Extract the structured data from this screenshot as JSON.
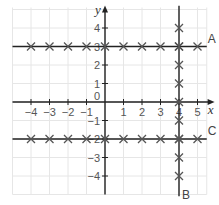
{
  "chart_data": {
    "type": "scatter",
    "title": "",
    "xlabel": "x",
    "ylabel": "y",
    "xlim": [
      -5,
      5.5
    ],
    "ylim": [
      -5,
      5
    ],
    "grid": true,
    "x_ticks": [
      "-4",
      "-3",
      "-2",
      "-1",
      "0",
      "1",
      "2",
      "3",
      "4",
      "5"
    ],
    "y_ticks": [
      "4",
      "3",
      "2",
      "1",
      "-1",
      "-2",
      "-3",
      "-4"
    ],
    "series": [
      {
        "name": "A",
        "line": "y = 3",
        "points": [
          [
            -4,
            3
          ],
          [
            -3,
            3
          ],
          [
            -2,
            3
          ],
          [
            -1,
            3
          ],
          [
            0,
            3
          ],
          [
            1,
            3
          ],
          [
            2,
            3
          ],
          [
            3,
            3
          ],
          [
            4,
            3
          ],
          [
            5,
            3
          ]
        ]
      },
      {
        "name": "B",
        "line": "x = 4",
        "points": [
          [
            4,
            4
          ],
          [
            4,
            3
          ],
          [
            4,
            2
          ],
          [
            4,
            1
          ],
          [
            4,
            0
          ],
          [
            4,
            -1
          ],
          [
            4,
            -2
          ],
          [
            4,
            -3
          ],
          [
            4,
            -4
          ]
        ]
      },
      {
        "name": "C",
        "line": "y = -2",
        "points": [
          [
            -4,
            -2
          ],
          [
            -3,
            -2
          ],
          [
            -2,
            -2
          ],
          [
            -1,
            -2
          ],
          [
            0,
            -2
          ],
          [
            1,
            -2
          ],
          [
            2,
            -2
          ],
          [
            3,
            -2
          ],
          [
            4,
            -2
          ],
          [
            5,
            -2
          ]
        ]
      }
    ],
    "colors": {
      "grid": "#e6e6e6",
      "axis": "#222222",
      "marker": "#555555"
    }
  }
}
